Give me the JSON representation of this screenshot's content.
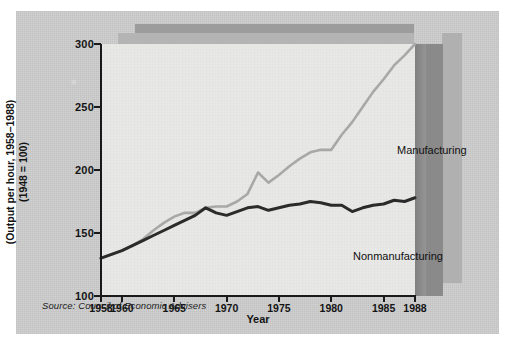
{
  "figure": {
    "y_axis_title_line1": "(Output per hour, 1958–1988)",
    "y_axis_title_line2": "(1948 = 100)",
    "x_axis_title": "Year",
    "source_note": "Source: Council of Economic Advisers"
  },
  "chart_data": {
    "type": "line",
    "title": "",
    "subtitle": "",
    "xlabel": "Year",
    "ylabel": "(Output per hour, 1958–1988) (1948 = 100)",
    "xlim": [
      1958,
      1988
    ],
    "ylim": [
      100,
      300
    ],
    "ytick_labels": [
      "100",
      "150",
      "200",
      "250",
      "300"
    ],
    "ytick_values": [
      100,
      150,
      200,
      250,
      300
    ],
    "xtick_labels": [
      "1958",
      "1960",
      "1965",
      "1970",
      "1975",
      "1980",
      "1985",
      "1988"
    ],
    "xtick_values": [
      1958,
      1960,
      1965,
      1970,
      1975,
      1980,
      1985,
      1988
    ],
    "grid": false,
    "legend": "inline-annotations",
    "x": [
      1958,
      1959,
      1960,
      1961,
      1962,
      1963,
      1964,
      1965,
      1966,
      1967,
      1968,
      1969,
      1970,
      1971,
      1972,
      1973,
      1974,
      1975,
      1976,
      1977,
      1978,
      1979,
      1980,
      1981,
      1982,
      1983,
      1984,
      1985,
      1986,
      1987,
      1988
    ],
    "series": [
      {
        "name": "Manufacturing",
        "color": "#a8a8a8",
        "values": [
          130,
          133,
          136,
          140,
          145,
          152,
          158,
          163,
          166,
          166,
          170,
          171,
          171,
          175,
          181,
          198,
          190,
          196,
          203,
          209,
          214,
          216,
          216,
          228,
          238,
          250,
          262,
          272,
          283,
          291,
          300
        ]
      },
      {
        "name": "Nonmanufacturing",
        "color": "#2b2b2b",
        "values": [
          130,
          133,
          136,
          140,
          144,
          148,
          152,
          156,
          160,
          164,
          170,
          166,
          164,
          167,
          170,
          171,
          168,
          170,
          172,
          173,
          175,
          174,
          172,
          172,
          167,
          170,
          172,
          173,
          176,
          175,
          178
        ]
      }
    ],
    "annotations": [
      {
        "text": "Manufacturing",
        "series": "Manufacturing"
      },
      {
        "text": "Nonmanufacturing",
        "series": "Nonmanufacturing"
      }
    ]
  }
}
